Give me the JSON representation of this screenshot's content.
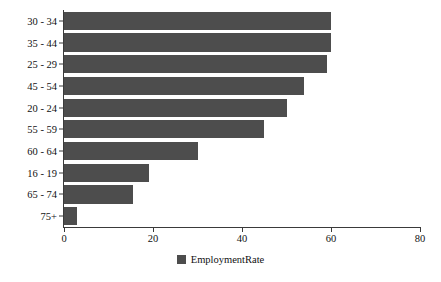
{
  "chart_data": {
    "type": "bar",
    "orientation": "horizontal",
    "title": "",
    "xlabel": "",
    "ylabel": "",
    "categories": [
      "30 - 34",
      "35 - 44",
      "25 - 29",
      "45 - 54",
      "20 - 24",
      "55 - 59",
      "60 - 64",
      "16 - 19",
      "65 - 74",
      "75+"
    ],
    "series": [
      {
        "name": "EmploymentRate",
        "color": "#4d4d4d",
        "values": [
          60,
          60,
          59,
          54,
          50,
          45,
          30,
          19,
          15.5,
          3
        ]
      }
    ],
    "xlim": [
      0,
      80
    ],
    "xticks": [
      0,
      20,
      40,
      60,
      80
    ],
    "xtick_labels": [
      "0",
      "20",
      "40",
      "60",
      "80"
    ],
    "grid": false,
    "legend": {
      "position": "bottom-center",
      "entries": [
        {
          "label": "EmploymentRate",
          "color": "#4d4d4d"
        }
      ]
    }
  }
}
